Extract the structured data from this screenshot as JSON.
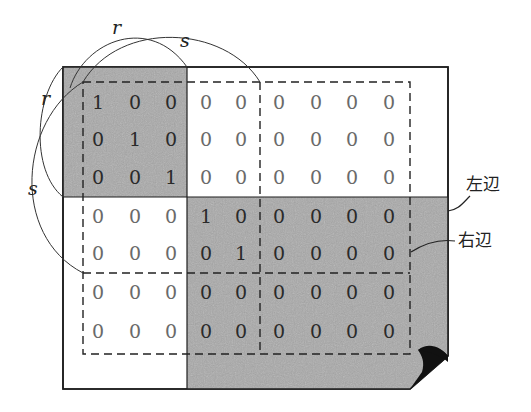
{
  "diagram": {
    "colors": {
      "shade": "#a9a9a9",
      "line": "#1e1e1e",
      "paper": "#ffffff",
      "curl": "#111111"
    },
    "arc_labels": {
      "top_r": "r",
      "top_s": "s",
      "left_r": "r",
      "left_s": "s"
    },
    "edge_labels": {
      "left_edge": "左辺",
      "right_edge": "右辺"
    },
    "matrix": {
      "rows": [
        [
          "1",
          "0",
          "0",
          "0",
          "0",
          "0",
          "0",
          "0",
          "0"
        ],
        [
          "0",
          "1",
          "0",
          "0",
          "0",
          "0",
          "0",
          "0",
          "0"
        ],
        [
          "0",
          "0",
          "1",
          "0",
          "0",
          "0",
          "0",
          "0",
          "0"
        ],
        [
          "0",
          "0",
          "0",
          "1",
          "0",
          "0",
          "0",
          "0",
          "0"
        ],
        [
          "0",
          "0",
          "0",
          "0",
          "1",
          "0",
          "0",
          "0",
          "0"
        ],
        [
          "0",
          "0",
          "0",
          "0",
          "0",
          "0",
          "0",
          "0",
          "0"
        ],
        [
          "0",
          "0",
          "0",
          "0",
          "0",
          "0",
          "0",
          "0",
          "0"
        ]
      ],
      "col_x": [
        98,
        135,
        171,
        206,
        241,
        279,
        316,
        352,
        389
      ],
      "row_y": [
        102,
        139,
        177,
        216,
        253,
        292,
        331
      ]
    }
  }
}
